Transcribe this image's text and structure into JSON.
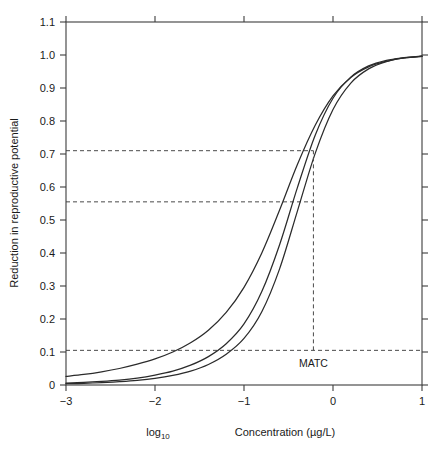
{
  "chart_data": {
    "type": "line",
    "title": "",
    "xlabel_prefix": "log",
    "xlabel_subscript": "10",
    "xlabel_main": "Concentration (µg/L)",
    "ylabel": "Reduction in reproductive potential",
    "xlim": [
      -3,
      1
    ],
    "ylim": [
      0,
      1.1
    ],
    "xticks": [
      -3,
      -2,
      -1,
      0,
      1
    ],
    "xtick_labels": [
      "−3",
      "−2",
      "−1",
      "0",
      "1"
    ],
    "yticks": [
      0,
      0.1,
      0.2,
      0.3,
      0.4,
      0.5,
      0.6,
      0.7,
      0.8,
      0.9,
      1.0,
      1.1
    ],
    "ytick_labels": [
      "0",
      "0.1",
      "0.2",
      "0.3",
      "0.4",
      "0.5",
      "0.6",
      "0.7",
      "0.8",
      "0.9",
      "1.0",
      "1.1"
    ],
    "grid": false,
    "legend": "none",
    "curve_color": "#2b2b2b",
    "guide_color": "#4a4a4a",
    "axis_color": "#3d3d3d",
    "annotations": [
      {
        "name": "matc",
        "label": "MATC",
        "x": -0.22,
        "y": 0.055,
        "type": "vertical-dashed-line",
        "line_from_y": 0.105,
        "line_to_y": 0.71
      }
    ],
    "guide_lines": [
      {
        "name": "upper-response",
        "orientation": "horizontal",
        "y": 0.71,
        "x_from": -3,
        "x_to": -0.22
      },
      {
        "name": "mid-response",
        "orientation": "horizontal",
        "y": 0.555,
        "x_from": -3,
        "x_to": -0.22
      },
      {
        "name": "lower-response",
        "orientation": "horizontal",
        "y": 0.105,
        "x_from": -3,
        "x_to": 1
      }
    ],
    "series": [
      {
        "name": "curve-left",
        "description": "leftmost dose-response sigmoid, shallowest slope",
        "x": [
          -3.0,
          -2.8,
          -2.6,
          -2.4,
          -2.2,
          -2.0,
          -1.8,
          -1.6,
          -1.4,
          -1.2,
          -1.0,
          -0.8,
          -0.6,
          -0.4,
          -0.2,
          0.0,
          0.2,
          0.4,
          0.6,
          0.8,
          1.0
        ],
        "y": [
          0.026,
          0.032,
          0.04,
          0.05,
          0.063,
          0.079,
          0.1,
          0.128,
          0.166,
          0.22,
          0.296,
          0.4,
          0.53,
          0.668,
          0.787,
          0.876,
          0.932,
          0.964,
          0.981,
          0.991,
          0.996
        ]
      },
      {
        "name": "curve-middle",
        "description": "middle dose-response sigmoid",
        "x": [
          -3.0,
          -2.8,
          -2.6,
          -2.4,
          -2.2,
          -2.0,
          -1.8,
          -1.6,
          -1.4,
          -1.2,
          -1.0,
          -0.8,
          -0.6,
          -0.4,
          -0.2,
          0.0,
          0.2,
          0.4,
          0.6,
          0.8,
          1.0
        ],
        "y": [
          0.006,
          0.008,
          0.011,
          0.015,
          0.021,
          0.03,
          0.042,
          0.06,
          0.086,
          0.125,
          0.185,
          0.283,
          0.425,
          0.598,
          0.757,
          0.869,
          0.933,
          0.967,
          0.984,
          0.992,
          0.997
        ]
      },
      {
        "name": "curve-right",
        "description": "rightmost dose-response sigmoid, steepest onset",
        "x": [
          -3.0,
          -2.8,
          -2.6,
          -2.4,
          -2.2,
          -2.0,
          -1.8,
          -1.6,
          -1.4,
          -1.2,
          -1.0,
          -0.8,
          -0.6,
          -0.4,
          -0.2,
          0.0,
          0.2,
          0.4,
          0.6,
          0.8,
          1.0
        ],
        "y": [
          0.004,
          0.005,
          0.007,
          0.01,
          0.014,
          0.02,
          0.029,
          0.042,
          0.062,
          0.093,
          0.141,
          0.222,
          0.352,
          0.527,
          0.702,
          0.835,
          0.915,
          0.958,
          0.98,
          0.991,
          0.996
        ]
      }
    ]
  }
}
